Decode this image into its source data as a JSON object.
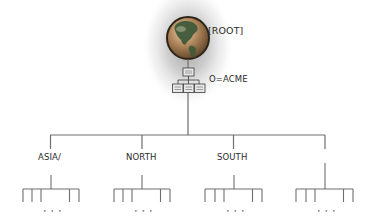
{
  "diagram": {
    "type": "directory-tree",
    "root": {
      "label": "[ROOT]",
      "icon": "globe-icon"
    },
    "organization": {
      "label": "O=ACME",
      "icon": "org-chart-icon"
    },
    "branches": [
      {
        "label": "ASIA/",
        "has_children": true,
        "ellipsis": "• • •"
      },
      {
        "label": "NORTH",
        "has_children": true,
        "ellipsis": "• • •"
      },
      {
        "label": "SOUTH",
        "has_children": true,
        "ellipsis": "• • •"
      },
      {
        "label": "",
        "has_children": true,
        "ellipsis": "• • •"
      }
    ],
    "colors": {
      "line": "#6e6e6e",
      "glow": "#bdbdbd",
      "globe_ocean": "#a27a52",
      "globe_land": "#3f5a3a",
      "globe_outline": "#2c2418",
      "text": "#2a2a2a"
    }
  }
}
